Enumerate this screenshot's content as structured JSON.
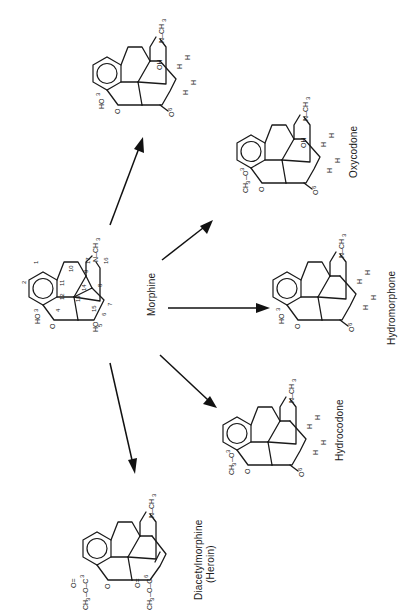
{
  "figure": {
    "orientation": "rotated-90-clockwise",
    "center_compound": {
      "name": "Morphine",
      "substituents": {
        "position3": "HO",
        "position6": "HO",
        "nitrogen": "N–CH3"
      },
      "ring_numbering": [
        "1",
        "2",
        "3",
        "4",
        "5",
        "6",
        "7",
        "8",
        "9",
        "10",
        "11",
        "12",
        "13",
        "14",
        "15",
        "16",
        "17"
      ]
    },
    "products": [
      {
        "name": "Oxymorphone",
        "position3": "HO",
        "position6": "O",
        "position14": "OH",
        "nitrogen": "N–CH3",
        "hydrogens": [
          "H",
          "H",
          "H",
          "H"
        ]
      },
      {
        "name": "Oxycodone",
        "position3": "CH3–O",
        "position6": "O",
        "position14": "OH",
        "nitrogen": "N–CH3",
        "hydrogens": [
          "H",
          "H",
          "H",
          "H"
        ]
      },
      {
        "name": "Hydromorphone",
        "position3": "HO",
        "position6": "O",
        "nitrogen": "N–CH3",
        "hydrogens": [
          "H",
          "H",
          "H",
          "H"
        ]
      },
      {
        "name": "Hydrocodone",
        "position3": "CH3–O",
        "position6": "O",
        "nitrogen": "N–CH3",
        "hydrogens": [
          "H",
          "H",
          "H",
          "H"
        ]
      },
      {
        "name_line1": "Diacetylmorphine",
        "name_line2": "(Heroin)",
        "position3": "CH3–O–C(=O)",
        "position6": "CH3–O–C(=O)",
        "nitrogen": "N–CH3",
        "double_bond": "7-8"
      }
    ],
    "labels": {
      "morphine": "Morphine",
      "oxymorphone": "Oxymorphone",
      "oxycodone": "Oxycodone",
      "hydromorphone": "Hydromorphone",
      "hydrocodone": "Hydrocodone",
      "heroin_line1": "Diacetylmorphine",
      "heroin_line2": "(Heroin)"
    },
    "atoms": {
      "HO": "HO",
      "O": "O",
      "OH": "OH",
      "H": "H",
      "N": "N",
      "NCH3": "N–CH",
      "sub3": "3",
      "CH3O": "CH",
      "C": "C",
      "dash": "–"
    },
    "numbers": [
      "1",
      "2",
      "3",
      "4",
      "5",
      "6",
      "7",
      "8",
      "9",
      "10",
      "11",
      "12",
      "13",
      "14",
      "15",
      "16",
      "17"
    ],
    "arrows": [
      {
        "to": "Oxymorphone"
      },
      {
        "to": "Oxycodone"
      },
      {
        "to": "Hydromorphone"
      },
      {
        "to": "Hydrocodone"
      },
      {
        "to": "Diacetylmorphine (Heroin)"
      }
    ]
  }
}
